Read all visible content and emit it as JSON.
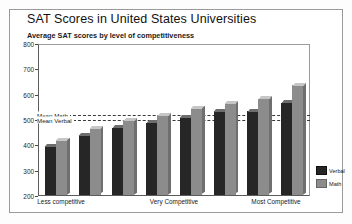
{
  "chart_data": {
    "type": "bar",
    "title": "SAT Scores in United States Universities",
    "subtitle": "Average SAT scores by level of competitiveness",
    "xlabel": "",
    "ylabel": "",
    "ylim": [
      200,
      800
    ],
    "yticks": [
      200,
      300,
      400,
      500,
      600,
      700,
      800
    ],
    "grid": false,
    "legend_position": "right",
    "categories": [
      "1",
      "2",
      "3",
      "4",
      "5",
      "6",
      "7",
      "8"
    ],
    "xtick_labels": [
      "Less competitive",
      "Very Competitive",
      "Most Competitive"
    ],
    "series": [
      {
        "name": "Verbal",
        "color": "#262626",
        "values": [
          395,
          440,
          470,
          490,
          510,
          535,
          535,
          570
        ]
      },
      {
        "name": "Math",
        "color": "#8c8c8c",
        "values": [
          420,
          465,
          500,
          520,
          545,
          565,
          585,
          640
        ]
      }
    ],
    "annotations": [
      {
        "label": "Mean Math",
        "value": 520
      },
      {
        "label": "Mean Verbal",
        "value": 500
      }
    ]
  },
  "legend": {
    "items": [
      {
        "label": "Verbal",
        "color": "#262626"
      },
      {
        "label": "Math",
        "color": "#8c8c8c"
      }
    ]
  }
}
